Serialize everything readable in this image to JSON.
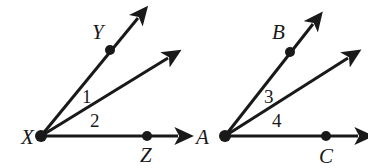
{
  "figure": {
    "background_color": "#ffffff",
    "stroke_color": "#191919",
    "label_color": "#191919",
    "width": 368,
    "height": 168
  },
  "diagrams": [
    {
      "id": "left-figure",
      "vertex": {
        "name": "X",
        "label": "X",
        "x": 41,
        "y": 136,
        "label_x": 21,
        "label_y": 127
      },
      "rays": [
        {
          "name": "ray-XY",
          "from": [
            41,
            136
          ],
          "to": [
            138,
            18
          ],
          "marked_point": {
            "label": "Y",
            "x": 110,
            "y": 50,
            "label_x": 92,
            "label_y": 22
          }
        },
        {
          "name": "ray-X-middle",
          "from": [
            41,
            136
          ],
          "to": [
            168,
            58
          ],
          "marked_point": null
        },
        {
          "name": "ray-XZ",
          "from": [
            41,
            136
          ],
          "to": [
            178,
            136
          ],
          "marked_point": {
            "label": "Z",
            "x": 147,
            "y": 136,
            "label_x": 140,
            "label_y": 145
          }
        }
      ],
      "angles": [
        {
          "name": "angle-1",
          "label": "1",
          "x": 82,
          "y": 87
        },
        {
          "name": "angle-2",
          "label": "2",
          "x": 90,
          "y": 111
        }
      ]
    },
    {
      "id": "right-figure",
      "vertex": {
        "name": "A",
        "label": "A",
        "x": 225,
        "y": 136,
        "label_x": 196,
        "label_y": 127
      },
      "rays": [
        {
          "name": "ray-AB",
          "from": [
            225,
            136
          ],
          "to": [
            313,
            24
          ],
          "marked_point": {
            "label": "B",
            "x": 290,
            "y": 52,
            "label_x": 272,
            "label_y": 22
          }
        },
        {
          "name": "ray-A-middle",
          "from": [
            225,
            136
          ],
          "to": [
            348,
            58
          ],
          "marked_point": null
        },
        {
          "name": "ray-AC",
          "from": [
            225,
            136
          ],
          "to": [
            358,
            136
          ],
          "marked_point": {
            "label": "C",
            "x": 326,
            "y": 136,
            "label_x": 319,
            "label_y": 146
          }
        }
      ],
      "angles": [
        {
          "name": "angle-3",
          "label": "3",
          "x": 264,
          "y": 87
        },
        {
          "name": "angle-4",
          "label": "4",
          "x": 272,
          "y": 111
        }
      ]
    }
  ]
}
